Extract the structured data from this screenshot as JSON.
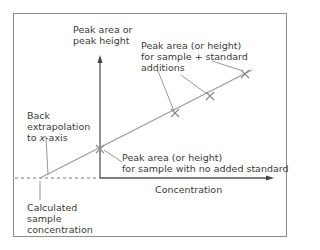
{
  "diagram": {
    "y_axis_label_line1": "Peak area or",
    "y_axis_label_line2": "peak height",
    "x_axis_label": "Concentration",
    "additions_label_line1": "Peak area (or height)",
    "additions_label_line2": "for sample + standard",
    "additions_label_line3": "additions",
    "no_standard_label_line1": "Peak area (or height)",
    "no_standard_label_line2": "for sample with no added standard",
    "back_extrapolation_line1": "Back",
    "back_extrapolation_line2": "extrapolation",
    "back_extrapolation_line3_prefix": "to ",
    "back_extrapolation_line3_italic": "x",
    "back_extrapolation_line3_suffix": "-axis",
    "calculated_line1": "Calculated",
    "calculated_line2": "sample",
    "calculated_line3": "concentration",
    "colors": {
      "axis": "#555555",
      "line": "#999999",
      "marker": "#888888",
      "text": "#3a3a3a",
      "frame": "#8c8c8c"
    },
    "points": [
      {
        "name": "sample-no-standard",
        "x": 100,
        "y": 149
      },
      {
        "name": "addition-1",
        "x": 175,
        "y": 113
      },
      {
        "name": "addition-2",
        "x": 210,
        "y": 96
      },
      {
        "name": "addition-3",
        "x": 245,
        "y": 74
      }
    ]
  }
}
